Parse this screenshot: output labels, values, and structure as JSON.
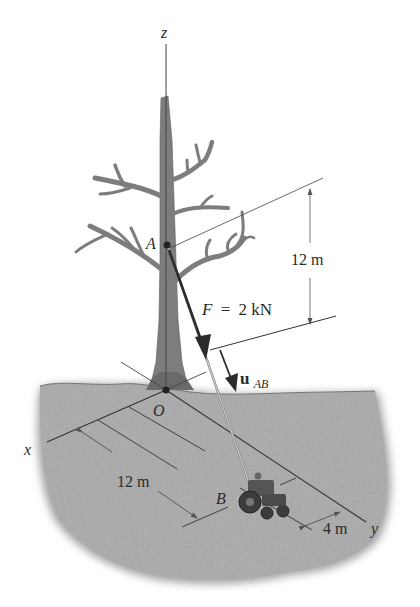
{
  "figure": {
    "type": "statics-force-vector-diagram"
  },
  "axes": {
    "z": "z",
    "x": "x",
    "y": "y",
    "origin": "O"
  },
  "points": {
    "A": "A",
    "B": "B"
  },
  "force": {
    "label": "F = 2 kN",
    "symbol": "F",
    "equals": "=",
    "value": "2 kN"
  },
  "unit_vector": {
    "symbol": "u",
    "subscript": "AB"
  },
  "dimensions": {
    "height_A": "12 m",
    "along_x": "12 m",
    "along_y": "4 m"
  },
  "colors": {
    "ground": "#a9a9a9",
    "tree": "#7d7d7d",
    "lines": "#333333",
    "force_arrow": "#2b2b2b"
  }
}
